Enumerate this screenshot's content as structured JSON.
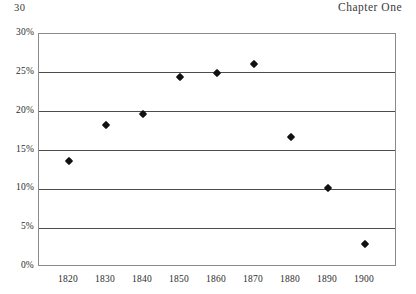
{
  "header": {
    "folio": "30",
    "running_title": "Chapter One"
  },
  "chart_data": {
    "type": "scatter",
    "title": "",
    "subtitle": "",
    "xlabel": "",
    "ylabel": "",
    "categories": [
      "1820",
      "1830",
      "1840",
      "1850",
      "1860",
      "1870",
      "1880",
      "1890",
      "1900"
    ],
    "x": [
      1820,
      1830,
      1840,
      1850,
      1860,
      1870,
      1880,
      1890,
      1900
    ],
    "values": [
      13.7,
      18.3,
      19.7,
      24.4,
      25.0,
      26.2,
      16.8,
      10.2,
      3.0
    ],
    "series": [
      {
        "name": "",
        "values": [
          13.7,
          18.3,
          19.7,
          24.4,
          25.0,
          26.2,
          16.8,
          10.2,
          3.0
        ]
      }
    ],
    "ylim": [
      0,
      30
    ],
    "xlim": [
      1815,
      1905
    ],
    "ytick_labels": [
      "0%",
      "5%",
      "10%",
      "15%",
      "20%",
      "25%",
      "30%"
    ],
    "ytick_values": [
      0,
      5,
      10,
      15,
      20,
      25,
      30
    ],
    "xtick_labels": [
      "1820",
      "1830",
      "1840",
      "1850",
      "1860",
      "1870",
      "1880",
      "1890",
      "1900"
    ],
    "grid": true,
    "grid_axis": "y",
    "legend": false,
    "legend_position": "none",
    "marker": "diamond",
    "marker_color": "#111111",
    "annotations": []
  },
  "colors": {
    "marker": "#111111",
    "gridline": "#4d4d4d",
    "frame": "#8a8a8a",
    "text": "#2b2b2b",
    "background": "#ffffff"
  }
}
